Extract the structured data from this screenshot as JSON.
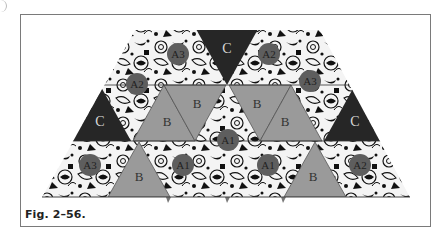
{
  "figure": {
    "caption": "Fig. 2–56.",
    "colors": {
      "frame": "#7a7a7a",
      "dark_triangle": "#262626",
      "gray_triangle": "#9a9a9a",
      "label_circle": "#5e5e5e",
      "floral_base": "#f4f4f4",
      "floral_ink": "#111111"
    }
  },
  "pieces": {
    "c_top": "C",
    "c_left": "C",
    "c_right": "C",
    "b_row2_1": "B",
    "b_row2_2": "B",
    "b_row2_3": "B",
    "b_row2_4": "B",
    "b_row3_left": "B",
    "b_row3_right": "B",
    "a3_top_left": "A3",
    "a2_top_right": "A2",
    "a2_upper_left": "A2",
    "a3_upper_right": "A3",
    "a1_center": "A1",
    "a3_lower_left": "A3",
    "a1_lower_left": "A1",
    "a1_lower_right": "A1",
    "a2_lower_right": "A2"
  }
}
